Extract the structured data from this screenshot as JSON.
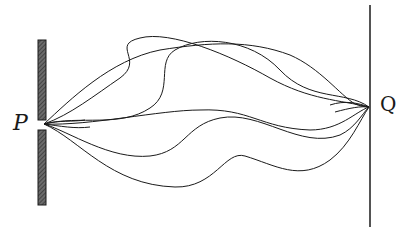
{
  "diagram": {
    "labels": {
      "source": "P",
      "target": "Q"
    },
    "colors": {
      "ink": "#1a1a1a",
      "barrier_fill": "#5a5a5a",
      "background": "#ffffff"
    },
    "barrier": {
      "x": 38,
      "width": 8,
      "top": 40,
      "bottom": 205,
      "slit_y": 124
    },
    "screen": {
      "x": 370,
      "top": 5,
      "bottom": 227
    },
    "path_count": 6
  }
}
